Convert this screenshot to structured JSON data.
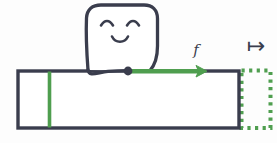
{
  "figure": {
    "background_color": "#fdfdfd",
    "width": 277,
    "height": 143
  },
  "colors": {
    "ink": "#3a3d4d",
    "accent_green": "#4f9e4f",
    "paper": "#ffffff"
  },
  "character": {
    "name": "smiling-blob",
    "expression": "happy",
    "eyes": "closed-arc-eyes",
    "mouth": "smile",
    "outline_color": "#3a3d4d",
    "fill_color": "#ffffff"
  },
  "bar": {
    "label": "domain-bar",
    "outline_color": "#3a3d4d",
    "fill_color": "#ffffff",
    "x": 17,
    "y": 70,
    "width": 222,
    "height": 58
  },
  "marks": {
    "green_tick": {
      "name": "input-tick",
      "color": "#4f9e4f",
      "x": 49,
      "orientation": "vertical"
    },
    "anchor_dot": {
      "name": "anchor-dot",
      "color": "#3a3d4d",
      "x": 128,
      "y": 71
    },
    "green_arrow": {
      "name": "transport-arrow",
      "color": "#4f9e4f",
      "from_x": 128,
      "to_x": 207,
      "y": 71,
      "direction": "right"
    },
    "dotted_box": {
      "name": "target-region",
      "color": "#4f9e4f",
      "style": "dotted",
      "x": 241,
      "y": 70,
      "width": 30,
      "height": 58
    }
  },
  "labels": {
    "function_label": "f",
    "mapsto_symbol": "↦",
    "mapsto_name": "maps-to-symbol"
  }
}
